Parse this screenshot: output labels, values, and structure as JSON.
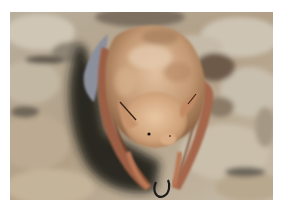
{
  "image": {
    "subject": "bat hanging upside down on cave rock",
    "alt": "Brown bat hanging from a cave ceiling, wings folded around its body",
    "colors": {
      "border": "#ffffff",
      "rock_light": "#c9bfae",
      "rock_mid": "#a89a86",
      "rock_dark": "#6f6658",
      "shadow": "#1e1a16",
      "fur_light": "#d9b38f",
      "fur_mid": "#b98d67",
      "fur_dark": "#8e6444",
      "wing": "#9c5f45",
      "wing_dark": "#6b3b28",
      "membrane_gray": "#8c8f9c",
      "claw": "#1a1a1a"
    }
  }
}
